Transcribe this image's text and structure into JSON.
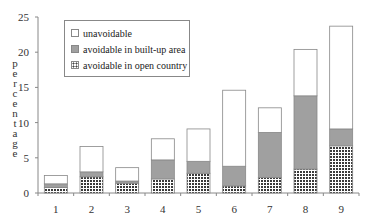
{
  "chart_data": {
    "type": "bar",
    "stacked": true,
    "title": "",
    "xlabel": "",
    "ylabel": "percentage",
    "ylim": [
      0,
      25
    ],
    "yticks": [
      0,
      5,
      10,
      15,
      20,
      25
    ],
    "categories": [
      "1",
      "2",
      "3",
      "4",
      "5",
      "6",
      "7",
      "8",
      "9"
    ],
    "series": [
      {
        "name": "avoidable in open country",
        "pattern": "crosshatch",
        "values": [
          0.8,
          2.3,
          1.4,
          2.0,
          2.8,
          1.0,
          2.2,
          3.4,
          6.7
        ]
      },
      {
        "name": "avoidable in built-up area",
        "pattern": "grey",
        "values": [
          0.5,
          0.7,
          0.3,
          2.7,
          1.7,
          2.8,
          6.4,
          10.4,
          2.4
        ]
      },
      {
        "name": "unavoidable",
        "pattern": "white",
        "values": [
          1.2,
          3.6,
          1.9,
          3.0,
          4.6,
          10.8,
          3.5,
          6.6,
          14.6
        ]
      }
    ],
    "totals": [
      2.5,
      6.6,
      3.6,
      7.7,
      9.1,
      14.6,
      12.1,
      20.4,
      23.7
    ],
    "grid": false,
    "legend_position": "upper-left-inside"
  },
  "legend": {
    "items": [
      {
        "label": "unavoidable",
        "swatch": "white"
      },
      {
        "label": "avoidable in built-up area",
        "swatch": "grey"
      },
      {
        "label": "avoidable in open country",
        "swatch": "hatch"
      }
    ]
  },
  "axis": {
    "ylabel_letters": [
      "p",
      "e",
      "r",
      "c",
      "e",
      "n",
      "t",
      "a",
      "g",
      "e"
    ]
  },
  "colors": {
    "grey_fill": "#a0a0a0",
    "hatch_dot": "#444444",
    "outline": "#888888"
  }
}
